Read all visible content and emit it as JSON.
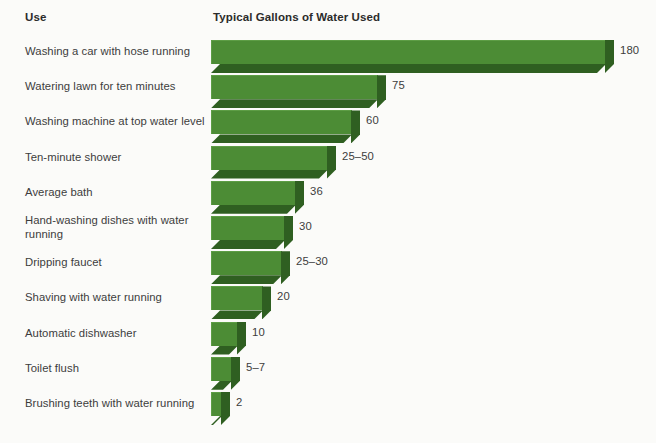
{
  "headers": {
    "use": "Use",
    "gallons": "Typical Gallons of Water Used"
  },
  "colors": {
    "bar_front": "#4c8c35",
    "bar_shade": "#2f5f21",
    "bar_highlight": "#5d9d45",
    "background": "#fbfbf9",
    "text": "#3d3d3d"
  },
  "chart_data": {
    "type": "bar",
    "title": "",
    "xlabel": "Typical Gallons of Water Used",
    "ylabel": "Use",
    "orientation": "horizontal",
    "grid": false,
    "legend": "none",
    "categories": [
      "Washing a car with hose running",
      "Watering lawn for ten minutes",
      "Washing machine at top water level",
      "Ten-minute shower",
      "Average bath",
      "Hand-washing dishes with water running",
      "Dripping faucet",
      "Shaving with water running",
      "Automatic dishwasher",
      "Toilet flush",
      "Brushing teeth with water running"
    ],
    "values": [
      180,
      75,
      60,
      37.5,
      36,
      30,
      27.5,
      20,
      10,
      6,
      2
    ],
    "value_labels": [
      "180",
      "75",
      "60",
      "25–50",
      "36",
      "30",
      "25–30",
      "20",
      "10",
      "5–7",
      "2"
    ],
    "xlim": [
      0,
      180
    ]
  },
  "rows": [
    {
      "label": "Washing a car with hose running",
      "value_label": "180",
      "bar_px": 395,
      "lines": 1
    },
    {
      "label": "Watering lawn for ten minutes",
      "value_label": "75",
      "bar_px": 167,
      "lines": 1
    },
    {
      "label": "Washing machine at top water level",
      "value_label": "60",
      "bar_px": 141,
      "lines": 1
    },
    {
      "label": "Ten-minute shower",
      "value_label": "25–50",
      "bar_px": 117,
      "lines": 1
    },
    {
      "label": "Average bath",
      "value_label": "36",
      "bar_px": 85,
      "lines": 1
    },
    {
      "label": "Hand-washing dishes with water running",
      "value_label": "30",
      "bar_px": 74,
      "lines": 2
    },
    {
      "label": "Dripping faucet",
      "value_label": "25–30",
      "bar_px": 71,
      "lines": 1
    },
    {
      "label": "Shaving with water running",
      "value_label": "20",
      "bar_px": 52,
      "lines": 1
    },
    {
      "label": "Automatic dishwasher",
      "value_label": "10",
      "bar_px": 27,
      "lines": 1
    },
    {
      "label": "Toilet flush",
      "value_label": "5–7",
      "bar_px": 21,
      "lines": 1
    },
    {
      "label": "Brushing teeth with water running",
      "value_label": "2",
      "bar_px": 11,
      "lines": 1
    }
  ],
  "layout": {
    "row_top_start": 38,
    "row_step": 35.2,
    "bar_left": 211,
    "depth": 9
  }
}
